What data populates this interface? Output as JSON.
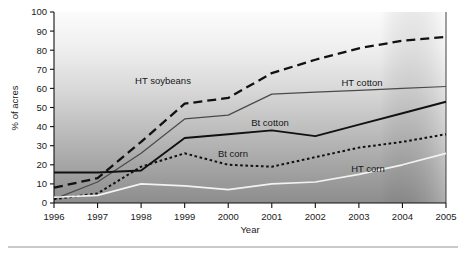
{
  "chart_data": {
    "type": "line",
    "title": "",
    "xlabel": "Year",
    "ylabel": "% of acres",
    "xlim": [
      1996,
      2005
    ],
    "ylim": [
      0,
      100
    ],
    "grid": false,
    "legend_position": "inline-annotations",
    "x": [
      1996,
      1997,
      1998,
      1999,
      2000,
      2001,
      2002,
      2003,
      2004,
      2005
    ],
    "xtick_labels": [
      "1996",
      "1997",
      "1998",
      "1999",
      "2000",
      "2001",
      "2002",
      "2003",
      "2004",
      "2005"
    ],
    "ytick_labels": [
      "0",
      "10",
      "20",
      "30",
      "40",
      "50",
      "60",
      "70",
      "80",
      "90",
      "100"
    ],
    "ytick_values": [
      0,
      10,
      20,
      30,
      40,
      50,
      60,
      70,
      80,
      90,
      100
    ],
    "series": [
      {
        "name": "HT soybeans",
        "style": "dashed",
        "color": "#111111",
        "values": [
          8,
          13,
          32,
          52,
          55,
          68,
          75,
          81,
          85,
          87
        ]
      },
      {
        "name": "HT cotton",
        "style": "solid-thin",
        "color": "#4a4a4a",
        "values": [
          2,
          11,
          26,
          44,
          46,
          57,
          58,
          59,
          60,
          61
        ]
      },
      {
        "name": "Bt cotton",
        "style": "solid-thick",
        "color": "#111111",
        "values": [
          16,
          16,
          17,
          34,
          36,
          38,
          35,
          41,
          47,
          53
        ]
      },
      {
        "name": "Bt corn",
        "style": "dotted",
        "color": "#111111",
        "values": [
          2,
          5,
          19,
          26,
          20,
          19,
          24,
          29,
          32,
          36
        ]
      },
      {
        "name": "HT corn",
        "style": "solid-white",
        "color": "#f2f2f2",
        "values": [
          3,
          4,
          10,
          9,
          7,
          10,
          11,
          15,
          20,
          26
        ]
      }
    ],
    "annotations": [
      {
        "text": "HT soybeans",
        "x_px": 163,
        "y_px": 84
      },
      {
        "text": "HT cotton",
        "x_px": 362,
        "y_px": 86
      },
      {
        "text": "Bt cotton",
        "x_px": 270,
        "y_px": 126
      },
      {
        "text": "Bt corn",
        "x_px": 233,
        "y_px": 157
      },
      {
        "text": "HT corn",
        "x_px": 368,
        "y_px": 172
      }
    ],
    "background": {
      "gradient_top": "#fafafa",
      "gradient_bottom": "#8f8f8f"
    }
  }
}
